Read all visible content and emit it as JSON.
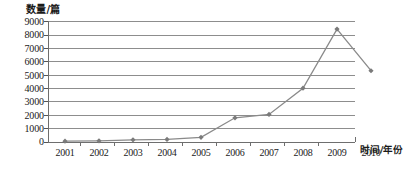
{
  "chart_data": {
    "type": "line",
    "title": "",
    "xlabel": "时间/年份",
    "ylabel": "数量/篇",
    "categories": [
      "2001",
      "2002",
      "2003",
      "2004",
      "2005",
      "2006",
      "2007",
      "2008",
      "2009",
      "2010"
    ],
    "values": [
      60,
      90,
      160,
      190,
      350,
      1800,
      2050,
      4000,
      8400,
      5300
    ],
    "series": [
      {
        "name": "数量/篇",
        "values": [
          60,
          90,
          160,
          190,
          350,
          1800,
          2050,
          4000,
          8400,
          5300
        ]
      }
    ],
    "ylim": [
      0,
      9000
    ],
    "ytick_labels": [
      "9000",
      "8000",
      "7000",
      "6000",
      "5000",
      "4000",
      "3000",
      "2000",
      "1000",
      "0"
    ],
    "ytick_values": [
      9000,
      8000,
      7000,
      6000,
      5000,
      4000,
      3000,
      2000,
      1000,
      0
    ],
    "grid": true,
    "legend": "none",
    "marker": "diamond",
    "line_color": "#8a8a8a",
    "marker_color": "#7a7a7a",
    "grid_color": "#8d8d8d",
    "axis_color": "#6e6e6e"
  }
}
